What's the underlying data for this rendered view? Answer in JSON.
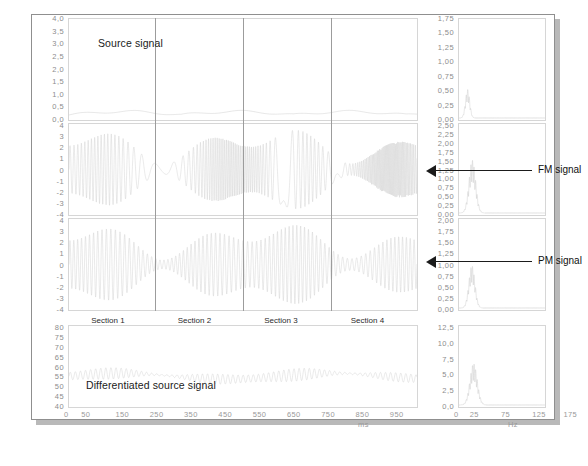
{
  "chart_data": {
    "type": "line",
    "title": "",
    "grid": false,
    "panels": [
      {
        "id": "source-signal",
        "label": "Source signal",
        "domain": "time",
        "xlabel": "ms",
        "ylabel": "",
        "ylim": [
          0.0,
          4.0
        ],
        "yticks": [
          "4,0",
          "3,5",
          "3,0",
          "2,5",
          "2,0",
          "1,5",
          "1,0",
          "0,5",
          "0,0"
        ],
        "ytick_values": [
          4.0,
          3.5,
          3.0,
          2.5,
          2.0,
          1.5,
          1.0,
          0.5,
          0.0
        ]
      },
      {
        "id": "fm-signal-time",
        "label": "",
        "domain": "time",
        "xlabel": "ms",
        "ylabel": "",
        "ylim": [
          -4,
          4
        ],
        "yticks": [
          "4",
          "3",
          "2",
          "1",
          "0",
          "-1",
          "-2",
          "-3",
          "-4"
        ],
        "ytick_values": [
          4,
          3,
          2,
          1,
          0,
          -1,
          -2,
          -3,
          -4
        ]
      },
      {
        "id": "pm-signal-time",
        "label": "",
        "domain": "time",
        "xlabel": "ms",
        "ylabel": "",
        "ylim": [
          -4,
          4
        ],
        "yticks": [
          "4",
          "3",
          "2",
          "1",
          "0",
          "-1",
          "-2",
          "-3",
          "-4"
        ],
        "ytick_values": [
          4,
          3,
          2,
          1,
          0,
          -1,
          -2,
          -3,
          -4
        ]
      },
      {
        "id": "differentiated-source-signal",
        "label": "Differentiated source signal",
        "domain": "time",
        "xlabel": "ms",
        "ylabel": "",
        "ylim": [
          40,
          80
        ],
        "yticks": [
          "80",
          "75",
          "70",
          "65",
          "60",
          "55",
          "50",
          "45",
          "40"
        ],
        "ytick_values": [
          80,
          75,
          70,
          65,
          60,
          55,
          50,
          45,
          40
        ]
      },
      {
        "id": "source-spectrum",
        "label": "",
        "domain": "frequency",
        "xlabel": "Hz",
        "ylabel": "",
        "ylim": [
          0.0,
          1.75
        ],
        "yticks": [
          "1,75",
          "1,50",
          "1,25",
          "1,00",
          "0,75",
          "0,50",
          "0,25",
          "0,00"
        ],
        "ytick_values": [
          1.75,
          1.5,
          1.25,
          1.0,
          0.75,
          0.5,
          0.25,
          0.0
        ]
      },
      {
        "id": "fm-spectrum",
        "label": "",
        "domain": "frequency",
        "xlabel": "Hz",
        "ylabel": "",
        "ylim": [
          0.0,
          2.5
        ],
        "yticks": [
          "2,50",
          "2,25",
          "2,00",
          "1,75",
          "1,50",
          "1,25",
          "1,00",
          "0,75",
          "0,50",
          "0,25",
          "0,00"
        ],
        "ytick_values": [
          2.5,
          2.25,
          2.0,
          1.75,
          1.5,
          1.25,
          1.0,
          0.75,
          0.5,
          0.25,
          0.0
        ]
      },
      {
        "id": "pm-spectrum",
        "label": "",
        "domain": "frequency",
        "xlabel": "Hz",
        "ylabel": "",
        "ylim": [
          0.0,
          2.0
        ],
        "yticks": [
          "2,00",
          "1,75",
          "1,50",
          "1,25",
          "1,00",
          "0,75",
          "0,50",
          "0,25",
          "0,00"
        ],
        "ytick_values": [
          2.0,
          1.75,
          1.5,
          1.25,
          1.0,
          0.75,
          0.5,
          0.25,
          0.0
        ]
      },
      {
        "id": "differentiated-spectrum",
        "label": "",
        "domain": "frequency",
        "xlabel": "Hz",
        "ylabel": "",
        "ylim": [
          0.0,
          12.5
        ],
        "yticks": [
          "12,5",
          "10,0",
          "7,5",
          "5,0",
          "2,5",
          "0,0"
        ],
        "ytick_values": [
          12.5,
          10.0,
          7.5,
          5.0,
          2.5,
          0.0
        ]
      }
    ],
    "x_axis_time": {
      "unit": "ms",
      "ticks": [
        "0",
        "50",
        "150",
        "250",
        "350",
        "450",
        "550",
        "650",
        "750",
        "850",
        "950"
      ],
      "tick_values": [
        0,
        50,
        150,
        250,
        350,
        450,
        550,
        650,
        750,
        850,
        950
      ],
      "xlim": [
        0,
        1000
      ]
    },
    "x_axis_freq": {
      "unit": "Hz",
      "ticks": [
        "0",
        "25",
        "75",
        "125",
        "175",
        "225"
      ],
      "tick_values": [
        0,
        25,
        75,
        125,
        175,
        225
      ],
      "xlim": [
        0,
        235
      ]
    },
    "sections": [
      {
        "label": "Section 1",
        "start_ms": 0,
        "end_ms": 250
      },
      {
        "label": "Section 2",
        "start_ms": 250,
        "end_ms": 500
      },
      {
        "label": "Section 3",
        "start_ms": 500,
        "end_ms": 750
      },
      {
        "label": "Section 4",
        "start_ms": 750,
        "end_ms": 1000
      }
    ],
    "annotations": [
      {
        "id": "fm-annotation",
        "label": "FM signal",
        "points_to": "fm-spectrum"
      },
      {
        "id": "pm-annotation",
        "label": "PM signal",
        "points_to": "pm-spectrum"
      }
    ],
    "colors": {
      "trace": "#c9c9c9",
      "panel_border": "#d6d6d6",
      "tick_text": "#9a9a9a",
      "annotation": "#1b1b1b",
      "paper": "#ffffff",
      "paper_shadow": "#b9b9b9"
    }
  }
}
